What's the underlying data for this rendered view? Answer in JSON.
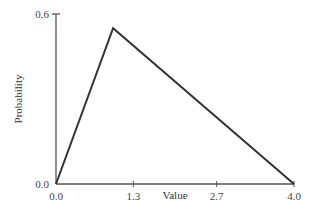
{
  "chart_data": {
    "type": "line",
    "title": "",
    "xlabel": "Value",
    "ylabel": "Probability",
    "x": [
      0.0,
      0.96,
      4.0
    ],
    "y": [
      0.0,
      0.55,
      0.0
    ],
    "series": [
      {
        "name": "triangular density",
        "x": [
          0.0,
          0.96,
          4.0
        ],
        "values": [
          0.0,
          0.55,
          0.0
        ]
      }
    ],
    "xlim": [
      0.0,
      4.0
    ],
    "ylim": [
      0.0,
      0.6
    ],
    "xticks": [
      "0.0",
      "1.3",
      "2.7",
      "4.0"
    ],
    "xtick_values": [
      0.0,
      1.3,
      2.7,
      4.0
    ],
    "yticks": [
      "0.0",
      "0.6"
    ],
    "ytick_values": [
      0.0,
      0.6
    ],
    "grid": false,
    "legend": null,
    "line_color": "#333333",
    "axis_color": "#555555"
  }
}
